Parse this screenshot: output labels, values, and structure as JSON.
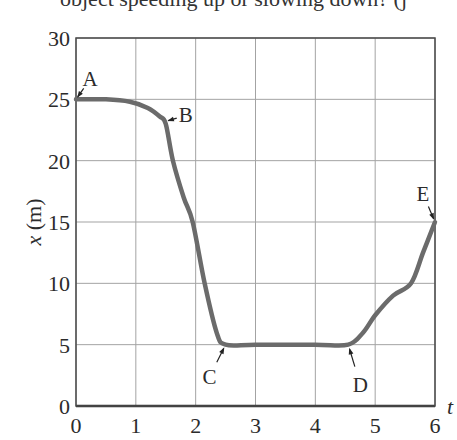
{
  "caption_fragment": "object speeding up or slowing down? (j",
  "chart_data": {
    "type": "line",
    "title": "",
    "xlabel": "t",
    "ylabel": "x (m)",
    "xlim": [
      0,
      6
    ],
    "ylim": [
      0,
      30
    ],
    "x_ticks": [
      "0",
      "1",
      "2",
      "3",
      "4",
      "5",
      "6"
    ],
    "y_ticks": [
      "0",
      "5",
      "10",
      "15",
      "20",
      "25",
      "30"
    ],
    "grid": true,
    "legend": null,
    "series": [
      {
        "name": "position",
        "color": "#6b6b6b",
        "points": [
          [
            0.0,
            25.0
          ],
          [
            0.5,
            25.0
          ],
          [
            0.9,
            24.8
          ],
          [
            1.2,
            24.3
          ],
          [
            1.4,
            23.6
          ],
          [
            1.5,
            23.0
          ],
          [
            1.62,
            20.0
          ],
          [
            1.8,
            17.0
          ],
          [
            1.95,
            15.0
          ],
          [
            2.15,
            10.0
          ],
          [
            2.35,
            6.0
          ],
          [
            2.5,
            5.0
          ],
          [
            3.0,
            5.0
          ],
          [
            4.0,
            5.0
          ],
          [
            4.55,
            5.0
          ],
          [
            4.8,
            6.0
          ],
          [
            5.0,
            7.4
          ],
          [
            5.3,
            9.0
          ],
          [
            5.6,
            10.0
          ],
          [
            5.8,
            12.5
          ],
          [
            6.0,
            15.0
          ]
        ]
      }
    ],
    "annotations": [
      {
        "label": "A",
        "t": 0.0,
        "x": 25.0
      },
      {
        "label": "B",
        "t": 1.5,
        "x": 23.2
      },
      {
        "label": "C",
        "t": 2.5,
        "x": 5.0
      },
      {
        "label": "D",
        "t": 4.55,
        "x": 5.0
      },
      {
        "label": "E",
        "t": 6.0,
        "x": 15.0
      }
    ]
  }
}
